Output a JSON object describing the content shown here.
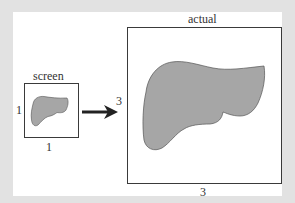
{
  "diagram": {
    "screen_box": {
      "title": "screen",
      "width_label": "1",
      "height_label": "1"
    },
    "actual_box": {
      "title": "actual",
      "width_label": "3",
      "height_label": "3"
    },
    "arrow": "arrow-right",
    "shape": "liver-silhouette",
    "colors": {
      "background": "#e2e2e2",
      "panel": "#ffffff",
      "shape_fill": "#a6a6a6",
      "stroke": "#3a3a3a"
    }
  }
}
